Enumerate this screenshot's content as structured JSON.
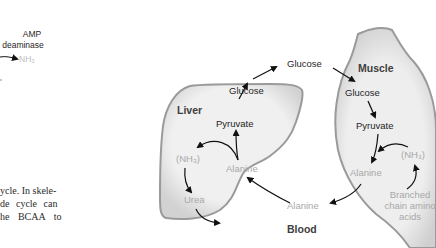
{
  "left_fragment": {
    "enzyme_line1": "AMP",
    "enzyme_line2": "deaminase",
    "product": "NH₃",
    "text_lines": [
      "ycle. In skele-",
      "de cycle can",
      "he BCAA to",
      "t   al t  i"
    ]
  },
  "diagram": {
    "liver": {
      "title": "Liver",
      "glucose": "Glucose",
      "pyruvate": "Pyruvate",
      "nh3": "(NH₃)",
      "alanine": "Alanine",
      "urea": "Urea"
    },
    "blood": {
      "title": "Blood",
      "glucose": "Glucose",
      "alanine": "Alanine"
    },
    "muscle": {
      "title": "Muscle",
      "glucose": "Glucose",
      "pyruvate": "Pyruvate",
      "alanine": "Alanine",
      "nh3": "(NH₃)",
      "bcaa_line1": "Branched",
      "bcaa_line2": "chain amino",
      "bcaa_line3": "acids"
    },
    "colors": {
      "organ_fill": "#ededed",
      "organ_edge": "#9a9a9a",
      "arrow": "#111111",
      "gray_text": "#a8a8a8"
    }
  }
}
